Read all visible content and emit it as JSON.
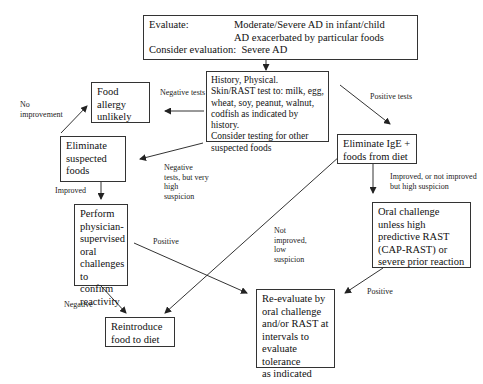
{
  "diagram": {
    "evaluate_box": {
      "label": "Evaluate:",
      "conditions": [
        "Moderate/Severe AD in infant/child",
        "AD exacerbated by particular foods"
      ],
      "consider_label": "Consider evaluation:",
      "consider_value": "Severe AD"
    },
    "history_box": {
      "text": "History, Physical.\nSkin/RAST test to: milk, egg,\nwheat, soy, peanut, walnut,\ncodfish as indicated by history.\nConsider testing for other\nsuspected foods"
    },
    "food_allergy_unlikely_box": {
      "text": "Food allergy\nunlikely"
    },
    "eliminate_suspected_box": {
      "text": "Eliminate\nsuspected\nfoods"
    },
    "eliminate_ige_box": {
      "text": "Eliminate IgE +\nfoods from diet"
    },
    "physician_challenge_box": {
      "text": "Perform\nphysician-\nsupervised\noral\nchallenges\nto confirm\nreactivity"
    },
    "oral_challenge_box": {
      "text": "Oral challenge\nunless high\npredictive RAST\n(CAP-RAST) or\nsevere prior reaction"
    },
    "reintroduce_box": {
      "text": "Reintroduce\nfood to diet"
    },
    "reevaluate_box": {
      "text": "Re-evaluate by\noral challenge\nand/or RAST at\nintervals to\nevaluate tolerance\nas indicated"
    },
    "edge_labels": {
      "negative_tests": "Negative tests",
      "positive_tests": "Positive tests",
      "no_improvement": "No\nimprovement",
      "negative_high_suspicion": "Negative\ntests, but very\nhigh\nsuspicion",
      "improved": "Improved",
      "improved_or_high_suspicion": "Improved, or not improved\nbut high suspicion",
      "positive_left": "Positive",
      "not_improved_low_suspicion": "Not\nimproved,\nlow\nsuspicion",
      "negative": "Negative",
      "positive_right": "Positive"
    }
  }
}
